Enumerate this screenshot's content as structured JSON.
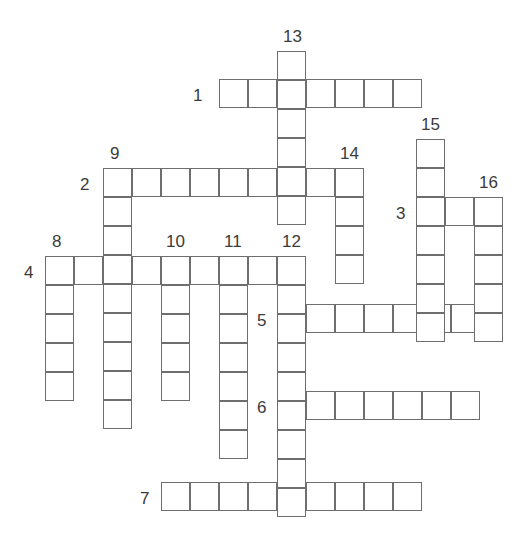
{
  "puzzle": {
    "kind": "crossword-grid",
    "title": "Crossword puzzle grid",
    "canvas": {
      "width": 532,
      "height": 536
    },
    "cell_size": 29,
    "line_color": "#6e6e6e",
    "number_color": "#3b3b3b",
    "background_color": "#ffffff",
    "entries": [
      {
        "number": "1",
        "direction": "across",
        "length": 7,
        "start_x": 219,
        "start_y": 79,
        "label_x": 193,
        "label_y": 87
      },
      {
        "number": "2",
        "direction": "across",
        "length": 9,
        "start_x": 103,
        "start_y": 168,
        "label_x": 80,
        "label_y": 176
      },
      {
        "number": "3",
        "direction": "across",
        "length": 3,
        "start_x": 416,
        "start_y": 197,
        "label_x": 396,
        "label_y": 205
      },
      {
        "number": "4",
        "direction": "across",
        "length": 8,
        "start_x": 45,
        "start_y": 256,
        "label_x": 24,
        "label_y": 264
      },
      {
        "number": "5",
        "direction": "across",
        "length": 7,
        "start_x": 277,
        "start_y": 304,
        "label_x": 257,
        "label_y": 312
      },
      {
        "number": "6",
        "direction": "across",
        "length": 7,
        "start_x": 277,
        "start_y": 391,
        "label_x": 257,
        "label_y": 399
      },
      {
        "number": "7",
        "direction": "across",
        "length": 9,
        "start_x": 161,
        "start_y": 482,
        "label_x": 140,
        "label_y": 490
      },
      {
        "number": "8",
        "direction": "down",
        "length": 5,
        "start_x": 45,
        "start_y": 256,
        "label_x": 52,
        "label_y": 233
      },
      {
        "number": "9",
        "direction": "down",
        "length": 9,
        "start_x": 103,
        "start_y": 168,
        "label_x": 110,
        "label_y": 145
      },
      {
        "number": "10",
        "direction": "down",
        "length": 5,
        "start_x": 161,
        "start_y": 256,
        "label_x": 166,
        "label_y": 233
      },
      {
        "number": "11",
        "direction": "down",
        "length": 7,
        "start_x": 219,
        "start_y": 256,
        "label_x": 224,
        "label_y": 233
      },
      {
        "number": "12",
        "direction": "down",
        "length": 9,
        "start_x": 277,
        "start_y": 256,
        "label_x": 282,
        "label_y": 233
      },
      {
        "number": "13",
        "direction": "down",
        "length": 6,
        "start_x": 277,
        "start_y": 51,
        "label_x": 283,
        "label_y": 28
      },
      {
        "number": "14",
        "direction": "down",
        "length": 4,
        "start_x": 335,
        "start_y": 168,
        "label_x": 340,
        "label_y": 145
      },
      {
        "number": "15",
        "direction": "down",
        "length": 7,
        "start_x": 416,
        "start_y": 139,
        "label_x": 421,
        "label_y": 116
      },
      {
        "number": "16",
        "direction": "down",
        "length": 5,
        "start_x": 474,
        "start_y": 197,
        "label_x": 479,
        "label_y": 174
      }
    ]
  }
}
